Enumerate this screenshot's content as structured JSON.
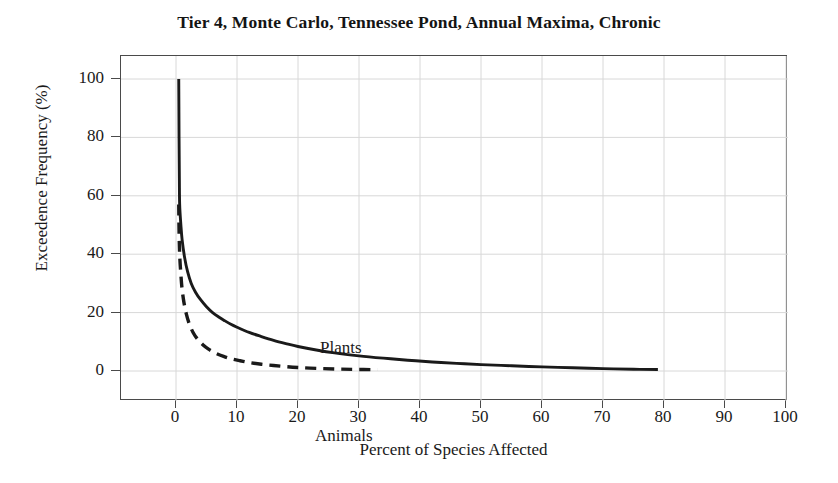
{
  "chart_data": {
    "type": "line",
    "title": "Tier 4, Monte Carlo, Tennessee Pond, Annual Maxima, Chronic",
    "xlabel": "Percent of Species Affected",
    "ylabel": "Exceedence Frequency (%)",
    "xlim": [
      0,
      100
    ],
    "ylim": [
      0,
      100
    ],
    "xticks": [
      0,
      10,
      20,
      30,
      40,
      50,
      60,
      70,
      80,
      90,
      100
    ],
    "yticks": [
      0,
      20,
      40,
      60,
      80,
      100
    ],
    "grid": true,
    "legend_position": "inline-annotations",
    "series": [
      {
        "name": "Plants",
        "style": "solid",
        "color": "#1a1a1a",
        "points": [
          [
            0.45,
            100.0
          ],
          [
            0.5,
            80.0
          ],
          [
            0.55,
            66.0
          ],
          [
            0.6,
            57.0
          ],
          [
            0.8,
            50.0
          ],
          [
            1.0,
            45.0
          ],
          [
            1.4,
            39.0
          ],
          [
            1.9,
            34.0
          ],
          [
            2.5,
            30.0
          ],
          [
            3.2,
            27.0
          ],
          [
            4.0,
            24.5
          ],
          [
            5.0,
            22.0
          ],
          [
            6.0,
            20.0
          ],
          [
            7.0,
            18.5
          ],
          [
            8.0,
            17.2
          ],
          [
            9.0,
            16.0
          ],
          [
            10.0,
            15.0
          ],
          [
            12.0,
            13.2
          ],
          [
            14.0,
            11.8
          ],
          [
            16.0,
            10.5
          ],
          [
            18.0,
            9.4
          ],
          [
            20.0,
            8.4
          ],
          [
            23.0,
            7.2
          ],
          [
            26.0,
            6.2
          ],
          [
            30.0,
            5.2
          ],
          [
            34.0,
            4.4
          ],
          [
            38.0,
            3.7
          ],
          [
            42.0,
            3.1
          ],
          [
            46.0,
            2.6
          ],
          [
            50.0,
            2.2
          ],
          [
            55.0,
            1.8
          ],
          [
            60.0,
            1.4
          ],
          [
            65.0,
            1.1
          ],
          [
            70.0,
            0.8
          ],
          [
            75.0,
            0.6
          ],
          [
            79.0,
            0.5
          ]
        ]
      },
      {
        "name": "Animals",
        "style": "dashed",
        "color": "#1a1a1a",
        "points": [
          [
            0.45,
            57.0
          ],
          [
            0.5,
            48.0
          ],
          [
            0.6,
            40.0
          ],
          [
            0.8,
            33.0
          ],
          [
            1.0,
            28.0
          ],
          [
            1.3,
            23.5
          ],
          [
            1.7,
            19.5
          ],
          [
            2.2,
            16.0
          ],
          [
            2.8,
            13.2
          ],
          [
            3.5,
            11.0
          ],
          [
            4.4,
            9.0
          ],
          [
            5.4,
            7.4
          ],
          [
            6.5,
            6.1
          ],
          [
            7.8,
            5.0
          ],
          [
            9.0,
            4.2
          ],
          [
            10.5,
            3.5
          ],
          [
            12.0,
            2.9
          ],
          [
            14.0,
            2.3
          ],
          [
            16.0,
            1.9
          ],
          [
            18.0,
            1.5
          ],
          [
            20.0,
            1.2
          ],
          [
            23.0,
            0.9
          ],
          [
            26.0,
            0.7
          ],
          [
            29.0,
            0.55
          ],
          [
            33.0,
            0.45
          ]
        ]
      }
    ]
  },
  "chart": {
    "title": "Tier 4, Monte Carlo, Tennessee Pond, Annual Maxima, Chronic",
    "x_axis": {
      "label": "Percent of Species Affected",
      "tick_labels": [
        "0",
        "10",
        "20",
        "30",
        "40",
        "50",
        "60",
        "70",
        "80",
        "90",
        "100"
      ]
    },
    "y_axis": {
      "label": "Exceedence Frequency (%)",
      "tick_labels": [
        "0",
        "20",
        "40",
        "60",
        "80",
        "100"
      ]
    },
    "annotations": {
      "plants": "Plants",
      "animals": "Animals"
    },
    "colors": {
      "line": "#1a1a1a",
      "grid": "#d8d8d8",
      "frame": "#4a4a4a",
      "background": "#ffffff"
    }
  }
}
